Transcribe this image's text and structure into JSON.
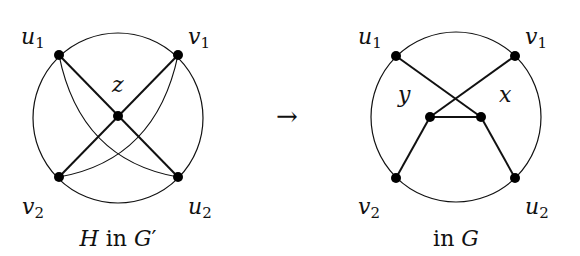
{
  "left_figure": {
    "caption": {
      "H": "H",
      "in": " in ",
      "G": "G",
      "prime": "′"
    },
    "labels": {
      "u1": {
        "base": "u",
        "sub": "1"
      },
      "v1": {
        "base": "v",
        "sub": "1"
      },
      "v2": {
        "base": "v",
        "sub": "2"
      },
      "u2": {
        "base": "u",
        "sub": "2"
      },
      "z": "z"
    }
  },
  "arrow": "→",
  "right_figure": {
    "caption": {
      "in": "in ",
      "G": "G"
    },
    "labels": {
      "u1": {
        "base": "u",
        "sub": "1"
      },
      "v1": {
        "base": "v",
        "sub": "1"
      },
      "v2": {
        "base": "v",
        "sub": "2"
      },
      "u2": {
        "base": "u",
        "sub": "2"
      },
      "y": "y",
      "x": "x"
    }
  },
  "colors": {
    "stroke": "#111111",
    "node": "#000000",
    "background": "#ffffff"
  }
}
